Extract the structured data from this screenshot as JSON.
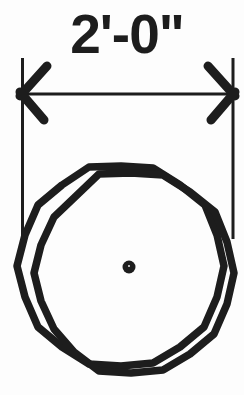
{
  "drawing": {
    "dimension_label": "2'-0\"",
    "ink_color": "#1d1d1d",
    "paper_color": "#fdfdfd"
  }
}
